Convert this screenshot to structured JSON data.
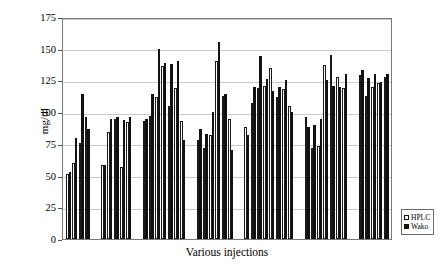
{
  "chart_data": {
    "type": "bar",
    "title": "",
    "subtitle": "",
    "xlabel": "Various injections",
    "ylabel": "mg/dl",
    "ylim": [
      0,
      175
    ],
    "yticks": [
      175,
      150,
      125,
      100,
      75,
      50,
      25,
      0
    ],
    "ytick_labels": [
      "175",
      "150",
      "125",
      "100",
      "75",
      "50",
      "25",
      "0"
    ],
    "xtick_labels": [],
    "grid": "horizontal",
    "legend_position": "bottom-right",
    "categories": [
      "1",
      "2",
      "3",
      "4",
      "5",
      "6",
      "7",
      "8",
      "9",
      "10",
      "11",
      "12",
      "13",
      "14",
      "15",
      "16",
      "17",
      "18",
      "19",
      "20",
      "21",
      "22",
      "23",
      "24",
      "25",
      "26",
      "27",
      "28",
      "29",
      "30",
      "31",
      "32",
      "33",
      "34",
      "35",
      "36",
      "37",
      "38",
      "39",
      "40",
      "41",
      "42"
    ],
    "groups": [
      {
        "name": "group-1",
        "indices": [
          0,
          1,
          2,
          3
        ]
      },
      {
        "name": "group-2",
        "indices": [
          4,
          5,
          6,
          7,
          8
        ]
      },
      {
        "name": "group-3",
        "indices": [
          9,
          10,
          11,
          12,
          13,
          14,
          15
        ]
      },
      {
        "name": "group-4",
        "indices": [
          16,
          17,
          18,
          19,
          20,
          21
        ]
      },
      {
        "name": "group-5",
        "indices": [
          22,
          23,
          24,
          25,
          26,
          27,
          28,
          29
        ]
      },
      {
        "name": "group-6",
        "indices": [
          30,
          31,
          32,
          33,
          34,
          35,
          36
        ]
      },
      {
        "name": "group-7",
        "indices": [
          37,
          38,
          39,
          40,
          41
        ]
      }
    ],
    "series": [
      {
        "name": "HPLC",
        "style": "open",
        "color": "#ffffff",
        "edge_color": "#111111",
        "values": [
          51,
          60,
          76,
          96,
          58,
          84,
          95,
          57,
          92,
          93,
          97,
          112,
          136,
          105,
          119,
          93,
          78,
          72,
          82,
          140,
          113,
          95,
          88,
          107,
          119,
          121,
          135,
          112,
          118,
          105,
          96,
          72,
          73,
          137,
          145,
          128,
          119,
          129,
          113,
          120,
          123,
          128
        ]
      },
      {
        "name": "Wako",
        "style": "filled",
        "color": "#111111",
        "edge_color": "#111111",
        "values": [
          53,
          80,
          114,
          87,
          58,
          95,
          96,
          94,
          96,
          95,
          114,
          150,
          139,
          138,
          140,
          78,
          87,
          83,
          100,
          155,
          114,
          70,
          82,
          120,
          144,
          126,
          117,
          120,
          125,
          100,
          88,
          90,
          95,
          125,
          121,
          120,
          130,
          133,
          127,
          130,
          124,
          130
        ]
      }
    ],
    "legend": [
      {
        "label": "HPLC",
        "marker": "open-square"
      },
      {
        "label": "Wako",
        "marker": "filled-square"
      }
    ]
  }
}
